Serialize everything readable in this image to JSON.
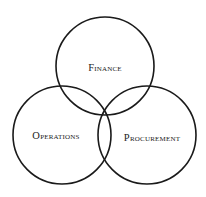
{
  "diagram": {
    "type": "venn",
    "sets": [
      {
        "id": "finance",
        "label": "Finance",
        "cx": 105,
        "cy": 66,
        "r": 49,
        "label_x": 105,
        "label_y": 68
      },
      {
        "id": "operations",
        "label": "Operations",
        "cx": 62,
        "cy": 135,
        "r": 49,
        "label_x": 56,
        "label_y": 136
      },
      {
        "id": "procurement",
        "label": "Procurement",
        "cx": 147,
        "cy": 135,
        "r": 49,
        "label_x": 152,
        "label_y": 138
      }
    ],
    "stroke_color": "#1a1a1a",
    "text_color": "#222222",
    "background": "#ffffff"
  }
}
